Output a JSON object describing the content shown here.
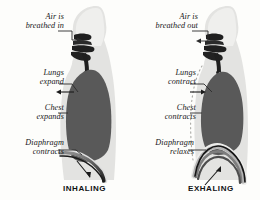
{
  "diagram": {
    "colors": {
      "background": "#fdfdfb",
      "body_silhouette": "#e3e3e1",
      "body_silhouette_light": "#eeeeec",
      "lung": "#595959",
      "airway": "#1f1f1f",
      "diaphragm": "#2a2a2a",
      "label_text": "#17171a",
      "caption_text": "#111114",
      "leader_line": "#2b2b2b",
      "dotted_outline": "#a9a9a4"
    }
  },
  "panels": [
    {
      "id": "inhaling",
      "caption": "INHALING",
      "labels": [
        {
          "id": "air-in",
          "line1": "Air is",
          "line2": "breathed in"
        },
        {
          "id": "lungs",
          "line1": "Lungs",
          "line2": "expand"
        },
        {
          "id": "chest",
          "line1": "Chest",
          "line2": "expands"
        },
        {
          "id": "diaphragm",
          "line1": "Diaphragm",
          "line2": "contracts"
        }
      ]
    },
    {
      "id": "exhaling",
      "caption": "EXHALING",
      "labels": [
        {
          "id": "air-out",
          "line1": "Air is",
          "line2": "breathed out"
        },
        {
          "id": "lungs",
          "line1": "Lungs",
          "line2": "contract"
        },
        {
          "id": "chest",
          "line1": "Chest",
          "line2": "contracts"
        },
        {
          "id": "diaphragm",
          "line1": "Diaphragm",
          "line2": "relaxes"
        }
      ]
    }
  ]
}
